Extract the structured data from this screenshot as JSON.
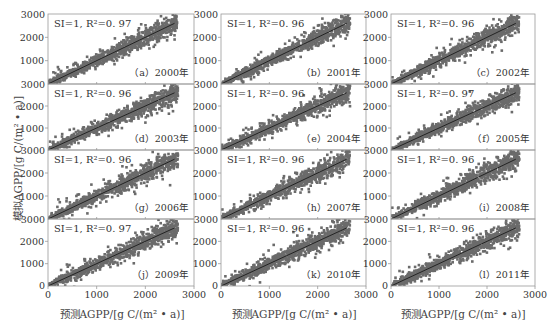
{
  "figure": {
    "ylabel": "模拟AGPP/[g C/(m² • a)]",
    "xlabel": "预测AGPP/[g C/(m² • a)]",
    "colors": {
      "points": "#6b6b6b",
      "fit_line": "#111111",
      "frame": "#9a9a9a",
      "text": "#333333"
    }
  },
  "chart_data": {
    "type": "scatter",
    "layout": {
      "rows": 4,
      "cols": 3,
      "grid": false,
      "shared_axes": true
    },
    "xlabel": "预测AGPP/[g C/(m² • a)]",
    "ylabel": "模拟AGPP/[g C/(m² • a)]",
    "xlim": [
      0,
      3000
    ],
    "ylim": [
      0,
      3000
    ],
    "xticks": [
      "0",
      "1000",
      "2000",
      "3000"
    ],
    "yticks": [
      "0",
      "1000",
      "2000",
      "3000"
    ],
    "fit_line": "y = x (SI = 1)",
    "panels": [
      {
        "label": "（a）2000年",
        "year": 2000,
        "annotation": "SI=1, R²=0. 97",
        "SI": 1,
        "R2": 0.97
      },
      {
        "label": "（b）2001年",
        "year": 2001,
        "annotation": "SI=1, R²=0. 96",
        "SI": 1,
        "R2": 0.96
      },
      {
        "label": "（c）2002年",
        "year": 2002,
        "annotation": "SI=1, R²=0. 96",
        "SI": 1,
        "R2": 0.96
      },
      {
        "label": "（d）2003年",
        "year": 2003,
        "annotation": "SI=1, R²=0. 96",
        "SI": 1,
        "R2": 0.96
      },
      {
        "label": "（e）2004年",
        "year": 2004,
        "annotation": "SI=1, R²=0. 96",
        "SI": 1,
        "R2": 0.96
      },
      {
        "label": "（f）2005年",
        "year": 2005,
        "annotation": "SI=1, R²=0. 97",
        "SI": 1,
        "R2": 0.97
      },
      {
        "label": "（g）2006年",
        "year": 2006,
        "annotation": "SI=1, R²=0. 96",
        "SI": 1,
        "R2": 0.96
      },
      {
        "label": "（h）2007年",
        "year": 2007,
        "annotation": "SI=1, R²=0. 96",
        "SI": 1,
        "R2": 0.96
      },
      {
        "label": "（i）2008年",
        "year": 2008,
        "annotation": "SI=1, R²=0. 96",
        "SI": 1,
        "R2": 0.96
      },
      {
        "label": "（j）2009年",
        "year": 2009,
        "annotation": "SI=1, R²=0. 97",
        "SI": 1,
        "R2": 0.97
      },
      {
        "label": "（k）2010年",
        "year": 2010,
        "annotation": "SI=1, R²=0. 96",
        "SI": 1,
        "R2": 0.96
      },
      {
        "label": "（l）2011年",
        "year": 2011,
        "annotation": "SI=1, R²=0. 96",
        "SI": 1,
        "R2": 0.96
      }
    ],
    "data_range_approx": {
      "x": [
        0,
        2700
      ],
      "y": [
        0,
        2750
      ]
    }
  }
}
